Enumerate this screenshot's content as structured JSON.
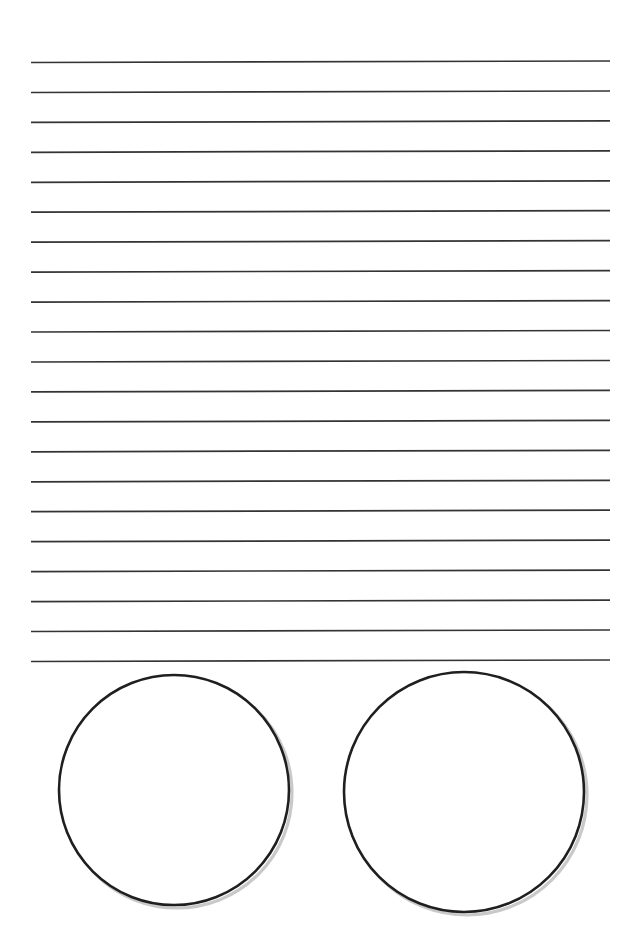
{
  "document": {
    "kind": "handwriting-practice-worksheet",
    "page_width": 637,
    "page_height": 930,
    "background_color": "#ffffff",
    "title_text": "",
    "body_text": "",
    "has_printed_text": false
  },
  "ruled_lines": {
    "name": "writing-lines",
    "count": 21,
    "color": "#343434",
    "thickness_px": 1.7,
    "x_start": 31,
    "x_end": 610,
    "y_first": 62.5,
    "y_spacing": 29.95,
    "tilt_px": -1.5,
    "y_positions": [
      62.5,
      92.5,
      122.4,
      152.3,
      182.3,
      212.2,
      242.2,
      272.1,
      302.1,
      332.0,
      362.0,
      391.9,
      421.9,
      451.8,
      481.8,
      511.7,
      541.7,
      571.6,
      601.6,
      631.5,
      661.5
    ]
  },
  "circles": {
    "name": "answer-circles",
    "count": 2,
    "stroke_color": "#1f1f1f",
    "stroke_width_px": 2.6,
    "fill_color": "#ffffff",
    "items": [
      {
        "label": "left-circle",
        "cx": 174,
        "cy": 790,
        "r": 115
      },
      {
        "label": "right-circle",
        "cx": 464,
        "cy": 792,
        "r": 120
      }
    ]
  }
}
